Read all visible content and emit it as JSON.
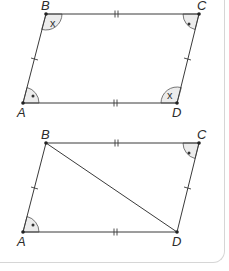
{
  "figures": [
    {
      "id": "parallelogram",
      "vertices": {
        "A": {
          "label": "A",
          "x": 23,
          "y": 103
        },
        "B": {
          "label": "B",
          "x": 46,
          "y": 14
        },
        "C": {
          "label": "C",
          "x": 199,
          "y": 14
        },
        "D": {
          "label": "D",
          "x": 177,
          "y": 103
        }
      },
      "angle_marks": {
        "B": "x",
        "C": "•",
        "A": "•",
        "D": "x"
      },
      "diagonal": false
    },
    {
      "id": "parallelogram-with-diagonal",
      "vertices": {
        "A": {
          "label": "A",
          "x": 23,
          "y": 232
        },
        "B": {
          "label": "B",
          "x": 46,
          "y": 143
        },
        "C": {
          "label": "C",
          "x": 199,
          "y": 143
        },
        "D": {
          "label": "D",
          "x": 177,
          "y": 232
        }
      },
      "angle_marks": {
        "C": "•",
        "A": "•"
      },
      "diagonal": true
    }
  ],
  "colors": {
    "line": "#3a3a3a",
    "angle_fill": "#ececec",
    "border": "#d6d6d6"
  }
}
